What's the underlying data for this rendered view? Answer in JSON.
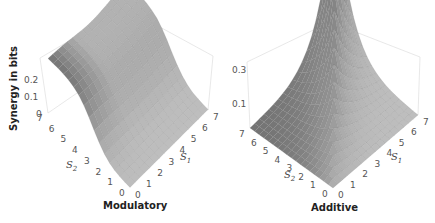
{
  "chart_data": [
    {
      "type": "surface3d",
      "title": "Modulatory",
      "zlabel": "Synergy in bits",
      "xlabel": "S1",
      "ylabel": "S2",
      "x_ticks": [
        "0",
        "1",
        "2",
        "3",
        "4",
        "5",
        "6",
        "7"
      ],
      "y_ticks": [
        "0",
        "1",
        "2",
        "3",
        "4",
        "5",
        "6",
        "7"
      ],
      "z_ticks": [
        "0",
        "0.1",
        "0.2"
      ],
      "xlim": [
        0,
        7
      ],
      "ylim": [
        0,
        7
      ],
      "zlim": [
        0,
        0.3
      ],
      "description": "Synergy is near 0 at low S1; rises steeply near S1≈2-3 to a plateau around 0.2-0.25 bits for large S1 along S2=7, forming a ridge/wall along the back-left edge; plateau dips slightly in the middle of S2.",
      "surface_samples": [
        {
          "S1": 0,
          "S2": 0,
          "synergy": 0.0
        },
        {
          "S1": 0,
          "S2": 7,
          "synergy": 0.25
        },
        {
          "S1": 7,
          "S2": 0,
          "synergy": 0.0
        },
        {
          "S1": 7,
          "S2": 7,
          "synergy": 0.22
        },
        {
          "S1": 3,
          "S2": 3,
          "synergy": 0.12
        },
        {
          "S1": 5,
          "S2": 5,
          "synergy": 0.18
        }
      ],
      "grid": false,
      "colormap": "gray"
    },
    {
      "type": "surface3d",
      "title": "Additive",
      "zlabel": "",
      "xlabel": "S1",
      "ylabel": "S2",
      "x_ticks": [
        "0",
        "1",
        "2",
        "3",
        "4",
        "5",
        "6",
        "7"
      ],
      "y_ticks": [
        "0",
        "1",
        "2",
        "3",
        "4",
        "5",
        "6",
        "7"
      ],
      "z_ticks": [
        "0.1",
        "0.3"
      ],
      "xlim": [
        0,
        7
      ],
      "ylim": [
        0,
        7
      ],
      "zlim": [
        0,
        0.4
      ],
      "description": "Synergy peaks sharply (~0.4 bits) along the diagonal at S1=S2=7, decaying quickly away from the diagonal toward ~0 at the edges; cusp-shaped ridge along S1=S2.",
      "surface_samples": [
        {
          "S1": 0,
          "S2": 0,
          "synergy": 0.0
        },
        {
          "S1": 7,
          "S2": 7,
          "synergy": 0.4
        },
        {
          "S1": 7,
          "S2": 0,
          "synergy": 0.0
        },
        {
          "S1": 0,
          "S2": 7,
          "synergy": 0.0
        },
        {
          "S1": 4,
          "S2": 4,
          "synergy": 0.15
        }
      ],
      "grid": false,
      "colormap": "gray"
    }
  ],
  "left": {
    "title": "Modulatory",
    "zlabel": "Synergy in bits",
    "z_ticks": [
      "0.2",
      "0.1",
      "0"
    ],
    "s2_ticks": [
      "7",
      "6",
      "5",
      "4",
      "3",
      "2",
      "1",
      "0"
    ],
    "s1_ticks": [
      "0",
      "1",
      "2",
      "3",
      "4",
      "5",
      "6",
      "7"
    ],
    "s1_label": "S",
    "s1_sub": "1",
    "s2_label": "S",
    "s2_sub": "2"
  },
  "right": {
    "title": "Additive",
    "z_ticks": [
      "0.3",
      "0.1"
    ],
    "s2_ticks": [
      "7",
      "6",
      "5",
      "4",
      "3",
      "2",
      "1",
      "0"
    ],
    "s1_ticks": [
      "0",
      "1",
      "2",
      "3",
      "4",
      "5",
      "6",
      "7"
    ],
    "s1_label": "S",
    "s1_sub": "1",
    "s2_label": "S",
    "s2_sub": "2"
  }
}
